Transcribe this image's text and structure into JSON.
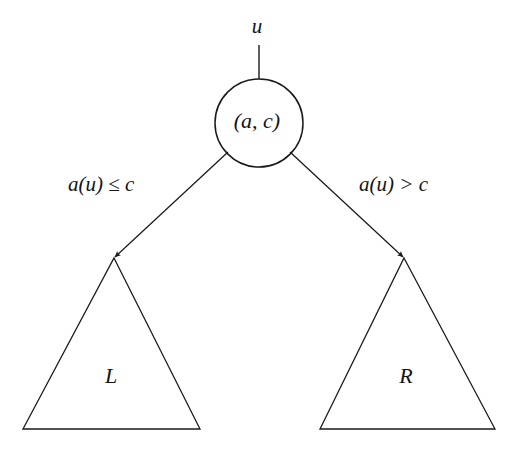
{
  "diagram": {
    "background_color": "#ffffff",
    "stroke_color": "#1a1a1a",
    "text_color": "#141414",
    "incoming_edge": {
      "label": "u",
      "from": [
        259,
        45
      ],
      "to": [
        259,
        88
      ],
      "arrowhead": "down"
    },
    "node": {
      "label": "(a, c)",
      "shape": "circle",
      "center": [
        259,
        123
      ],
      "radius": 44
    },
    "edges": [
      {
        "name": "left-branch",
        "label": "a(u) ≤ c",
        "from": [
          228,
          152
        ],
        "to": [
          114,
          258
        ],
        "arrowhead": "to-target"
      },
      {
        "name": "right-branch",
        "label": "a(u) > c",
        "from": [
          290,
          152
        ],
        "to": [
          404,
          258
        ],
        "arrowhead": "to-target"
      }
    ],
    "subtrees": [
      {
        "name": "left-subtree",
        "label": "L",
        "shape": "triangle",
        "apex": [
          114,
          258
        ],
        "base_left": [
          23,
          429
        ],
        "base_right": [
          200,
          429
        ]
      },
      {
        "name": "right-subtree",
        "label": "R",
        "shape": "triangle",
        "apex": [
          404,
          258
        ],
        "base_left": [
          320,
          429
        ],
        "base_right": [
          495,
          429
        ]
      }
    ]
  }
}
